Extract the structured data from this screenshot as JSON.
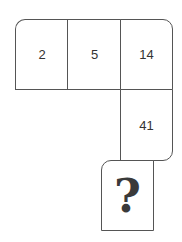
{
  "puzzle": {
    "cells": [
      "2",
      "5",
      "14",
      "41"
    ],
    "unknown": "?"
  }
}
